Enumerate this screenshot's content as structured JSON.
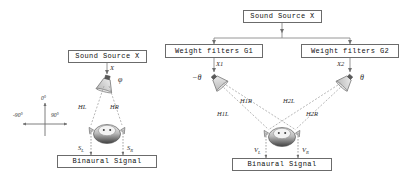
{
  "figure": {
    "type": "block-diagram",
    "panels": [
      "left",
      "right"
    ]
  },
  "left_panel": {
    "source_box": "Sound Source X",
    "output_box": "Binaural Signal",
    "signal_label": "X",
    "angle_label": "φ",
    "path_left": "HL",
    "path_right": "HR",
    "out_left": "S",
    "out_left_sub": "L",
    "out_right": "S",
    "out_right_sub": "R",
    "axis": {
      "front": "0°",
      "left": "-90°",
      "right": "90°"
    }
  },
  "right_panel": {
    "source_box": "Sound Source X",
    "filter_box_1": "Weight filters G1",
    "filter_box_2": "Weight filters G2",
    "output_box": "Binaural Signal",
    "signal_label_1": "X1",
    "signal_label_2": "X2",
    "angle_label_1": "−θ",
    "angle_label_2": "θ",
    "path_1_left": "H1L",
    "path_1_right": "H1R",
    "path_2_left": "H2L",
    "path_2_right": "H2R",
    "out_left": "V",
    "out_left_sub": "L",
    "out_right": "V",
    "out_right_sub": "R"
  },
  "colors": {
    "stroke": "#6b6b6b",
    "line": "#8a8a8a",
    "dashed": "#9a9a9a",
    "text": "#111111",
    "head_dark": "#4a4a4a",
    "head_light": "#d8d8d8",
    "speaker": "#cfcfcf"
  }
}
